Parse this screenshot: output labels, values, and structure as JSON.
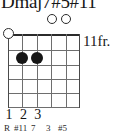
{
  "chord": {
    "name": "Dmaj7#5#11",
    "position_label": "11fr.",
    "strings": 6,
    "frets": 5
  },
  "open_markers": [
    {
      "string": 4,
      "symbol": "open-string-circle"
    },
    {
      "string": 5,
      "symbol": "open-string-circle"
    }
  ],
  "nut_marker": {
    "string": 1,
    "symbol": "open-string-circle"
  },
  "dots": [
    {
      "string": 2,
      "fret": 1
    },
    {
      "string": 3,
      "fret": 1
    }
  ],
  "fingering": [
    {
      "string": 1,
      "label": "1"
    },
    {
      "string": 2,
      "label": "2"
    },
    {
      "string": 3,
      "label": "3"
    }
  ],
  "intervals": [
    {
      "string": 1,
      "label": "R"
    },
    {
      "string": 2,
      "label": "#11"
    },
    {
      "string": 3,
      "label": "7"
    },
    {
      "string": 4,
      "label": "3"
    },
    {
      "string": 5,
      "label": "#5"
    }
  ],
  "colors": {
    "ink": "#161616",
    "grid": "#6e6e6e",
    "nut": "#2b2b2b",
    "background": "#ffffff"
  }
}
